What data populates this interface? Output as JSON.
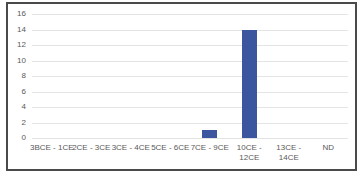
{
  "chart_data": {
    "type": "bar",
    "title": "",
    "xlabel": "",
    "ylabel": "",
    "categories": [
      "3BCE - 1CE",
      "2CE - 3CE",
      "3CE - 4CE",
      "5CE - 6CE",
      "7CE - 9CE",
      "10CE - 12CE",
      "13CE - 14CE",
      "ND"
    ],
    "xtick_labels": [
      "3BCE - 1CE",
      "2CE - 3CE",
      "3CE - 4CE",
      "5CE - 6CE",
      "7CE - 9CE",
      "10CE -\n12CE",
      "13CE -\n14CE",
      "ND"
    ],
    "values": [
      0,
      0,
      0,
      0,
      1,
      14,
      0,
      0
    ],
    "ylim": [
      0,
      16
    ],
    "yticks": [
      0,
      2,
      4,
      6,
      8,
      10,
      12,
      14,
      16
    ],
    "grid": true,
    "legend": false,
    "bar_color": "#3B559E",
    "gridline_color": "#E4E4E4",
    "axis_text_color": "#595959",
    "frame_border_color": "#4A4A4A",
    "background_color": "#FFFFFF"
  }
}
